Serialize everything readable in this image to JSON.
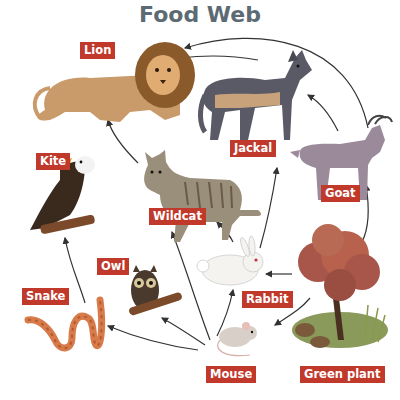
{
  "title": "Food Web",
  "colors": {
    "title": "#5c6b73",
    "label_bg": "#c0392b",
    "label_text": "#ffffff",
    "arrow": "#333333"
  },
  "organisms": {
    "lion": "Lion",
    "jackal": "Jackal",
    "kite": "Kite",
    "wildcat": "Wildcat",
    "goat": "Goat",
    "owl": "Owl",
    "snake": "Snake",
    "rabbit": "Rabbit",
    "mouse": "Mouse",
    "green_plant": "Green plant"
  },
  "arrows": [
    {
      "from": "Jackal",
      "to": "Lion"
    },
    {
      "from": "Goat",
      "to": "Lion"
    },
    {
      "from": "Wildcat",
      "to": "Lion"
    },
    {
      "from": "Goat",
      "to": "Jackal"
    },
    {
      "from": "Rabbit",
      "to": "Jackal"
    },
    {
      "from": "Green plant",
      "to": "Goat"
    },
    {
      "from": "Rabbit",
      "to": "Wildcat"
    },
    {
      "from": "Mouse",
      "to": "Wildcat"
    },
    {
      "from": "Snake",
      "to": "Kite"
    },
    {
      "from": "Mouse",
      "to": "Owl"
    },
    {
      "from": "Mouse",
      "to": "Snake"
    },
    {
      "from": "Mouse",
      "to": "Rabbit"
    },
    {
      "from": "Green plant",
      "to": "Rabbit"
    },
    {
      "from": "Green plant",
      "to": "Mouse"
    }
  ]
}
